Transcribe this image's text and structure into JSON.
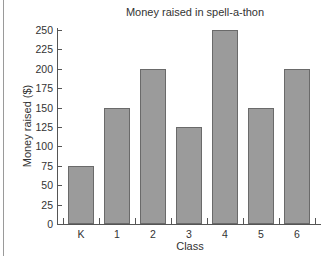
{
  "chart_data": {
    "type": "bar",
    "title": "Money raised in spell-a-thon",
    "xlabel": "Class",
    "ylabel": "Money raised ($)",
    "categories": [
      "K",
      "1",
      "2",
      "3",
      "4",
      "5",
      "6"
    ],
    "values": [
      75,
      150,
      200,
      125,
      250,
      150,
      200
    ],
    "ylim": [
      0,
      250
    ],
    "yticks": [
      0,
      25,
      50,
      75,
      100,
      125,
      150,
      175,
      200,
      225,
      250
    ],
    "grid": false,
    "legend": null,
    "bar_color": "#9b9b9b",
    "bar_edge_color": "#6a6a6a"
  }
}
